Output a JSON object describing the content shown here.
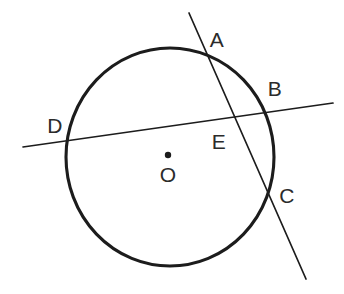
{
  "figure": {
    "background_color": "#ffffff",
    "ink_color": "#1c1c1c",
    "label_color": "#2b2b2b",
    "width": 344,
    "height": 294
  },
  "circle": {
    "name": "circle-O",
    "center_x": 170,
    "center_y": 157,
    "radius_x": 104,
    "radius_y": 109,
    "stroke_width": 3.1
  },
  "center_point": {
    "label": "O",
    "dot_x": 168,
    "dot_y": 155,
    "dot_radius": 3.2,
    "label_x": 168,
    "label_y": 176
  },
  "lines": [
    {
      "name": "secant-AC",
      "label": "AC",
      "x1": 189,
      "y1": 13,
      "x2": 306,
      "y2": 279,
      "stroke_width": 1.7
    },
    {
      "name": "secant-DB",
      "label": "DB",
      "x1": 23,
      "y1": 147,
      "x2": 333,
      "y2": 103,
      "stroke_width": 1.7
    }
  ],
  "points": [
    {
      "id": "A",
      "label": "A",
      "label_x": 217,
      "label_y": 41,
      "on_circle": true,
      "point_x": 206,
      "point_y": 60
    },
    {
      "id": "B",
      "label": "B",
      "label_x": 275,
      "label_y": 90,
      "on_circle": true,
      "point_x": 263,
      "point_y": 113
    },
    {
      "id": "C",
      "label": "C",
      "label_x": 287,
      "label_y": 197,
      "on_circle": true,
      "point_x": 270,
      "point_y": 190
    },
    {
      "id": "D",
      "label": "D",
      "label_x": 55,
      "label_y": 127,
      "on_circle": true,
      "point_x": 68,
      "point_y": 140
    },
    {
      "id": "E",
      "label": "E",
      "label_x": 219,
      "label_y": 143,
      "on_circle": false,
      "point_x": 233,
      "point_y": 115
    }
  ]
}
